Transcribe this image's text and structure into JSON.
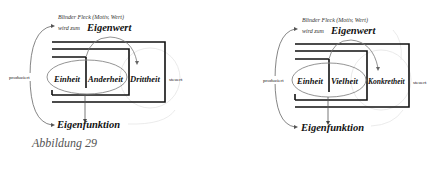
{
  "figures": [
    {
      "blind_spot": "Blinder Fleck (Motiv, Wert)",
      "becomes_prefix": "wird zum",
      "eigenwert": "Eigenwert",
      "produces": "produziert",
      "controls": "steuert",
      "term1": "Einheit",
      "term2": "Anderheit",
      "term3": "Drittheit",
      "eigenfunktion": "Eigenfunktion"
    },
    {
      "blind_spot": "Blinder Fleck (Motiv, Wert)",
      "becomes_prefix": "wird zum",
      "eigenwert": "Eigenwert",
      "produces": "produziert",
      "controls": "steuert",
      "term1": "Einheit",
      "term2": "Vielheit",
      "term3": "Konkretheit",
      "eigenfunktion": "Eigenfunktion"
    }
  ],
  "caption": "Abbildung 29"
}
